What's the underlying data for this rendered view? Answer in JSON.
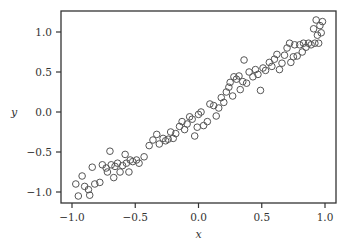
{
  "chart_data": {
    "type": "scatter",
    "title": "",
    "xlabel": "x",
    "ylabel": "y",
    "xlim": [
      -1.09,
      1.09
    ],
    "ylim": [
      -1.14,
      1.27
    ],
    "xticks": [
      -1.0,
      -0.5,
      0.0,
      0.5,
      1.0
    ],
    "xtick_labels": [
      "−1.0",
      "−0.5",
      "0.0",
      "0.5",
      "1.0"
    ],
    "yticks": [
      -1.0,
      -0.5,
      0.0,
      0.5,
      1.0
    ],
    "ytick_labels": [
      "−1.0",
      "−0.5",
      "0.0",
      "0.5",
      "1.0"
    ],
    "grid": false,
    "legend": null,
    "marker": "hollow-circle",
    "marker_color": "#555555",
    "points": [
      [
        -0.97,
        -0.9
      ],
      [
        -0.95,
        -1.05
      ],
      [
        -0.92,
        -0.8
      ],
      [
        -0.9,
        -0.93
      ],
      [
        -0.87,
        -0.97
      ],
      [
        -0.86,
        -1.04
      ],
      [
        -0.84,
        -0.69
      ],
      [
        -0.82,
        -0.9
      ],
      [
        -0.78,
        -0.88
      ],
      [
        -0.76,
        -0.66
      ],
      [
        -0.73,
        -0.7
      ],
      [
        -0.72,
        -0.75
      ],
      [
        -0.7,
        -0.49
      ],
      [
        -0.69,
        -0.66
      ],
      [
        -0.67,
        -0.82
      ],
      [
        -0.66,
        -0.68
      ],
      [
        -0.64,
        -0.64
      ],
      [
        -0.62,
        -0.75
      ],
      [
        -0.6,
        -0.67
      ],
      [
        -0.58,
        -0.53
      ],
      [
        -0.57,
        -0.64
      ],
      [
        -0.55,
        -0.75
      ],
      [
        -0.54,
        -0.6
      ],
      [
        -0.52,
        -0.62
      ],
      [
        -0.49,
        -0.6
      ],
      [
        -0.47,
        -0.64
      ],
      [
        -0.43,
        -0.56
      ],
      [
        -0.39,
        -0.42
      ],
      [
        -0.36,
        -0.35
      ],
      [
        -0.33,
        -0.28
      ],
      [
        -0.31,
        -0.4
      ],
      [
        -0.28,
        -0.33
      ],
      [
        -0.26,
        -0.36
      ],
      [
        -0.24,
        -0.34
      ],
      [
        -0.22,
        -0.25
      ],
      [
        -0.2,
        -0.33
      ],
      [
        -0.18,
        -0.27
      ],
      [
        -0.15,
        -0.18
      ],
      [
        -0.13,
        -0.12
      ],
      [
        -0.11,
        -0.22
      ],
      [
        -0.09,
        -0.15
      ],
      [
        -0.07,
        -0.06
      ],
      [
        -0.05,
        -0.09
      ],
      [
        -0.03,
        -0.3
      ],
      [
        -0.01,
        -0.19
      ],
      [
        0.0,
        -0.03
      ],
      [
        0.02,
        0.0
      ],
      [
        0.04,
        -0.17
      ],
      [
        0.07,
        -0.12
      ],
      [
        0.09,
        0.1
      ],
      [
        0.12,
        0.08
      ],
      [
        0.14,
        -0.05
      ],
      [
        0.16,
        0.05
      ],
      [
        0.18,
        0.18
      ],
      [
        0.2,
        0.12
      ],
      [
        0.22,
        0.25
      ],
      [
        0.24,
        0.31
      ],
      [
        0.25,
        0.37
      ],
      [
        0.27,
        0.2
      ],
      [
        0.28,
        0.44
      ],
      [
        0.3,
        0.41
      ],
      [
        0.32,
        0.45
      ],
      [
        0.33,
        0.28
      ],
      [
        0.35,
        0.38
      ],
      [
        0.36,
        0.65
      ],
      [
        0.38,
        0.36
      ],
      [
        0.4,
        0.5
      ],
      [
        0.43,
        0.44
      ],
      [
        0.45,
        0.53
      ],
      [
        0.47,
        0.47
      ],
      [
        0.49,
        0.27
      ],
      [
        0.51,
        0.55
      ],
      [
        0.53,
        0.52
      ],
      [
        0.56,
        0.62
      ],
      [
        0.58,
        0.57
      ],
      [
        0.6,
        0.66
      ],
      [
        0.62,
        0.72
      ],
      [
        0.64,
        0.53
      ],
      [
        0.66,
        0.61
      ],
      [
        0.68,
        0.71
      ],
      [
        0.7,
        0.8
      ],
      [
        0.72,
        0.86
      ],
      [
        0.73,
        0.62
      ],
      [
        0.75,
        0.69
      ],
      [
        0.76,
        0.84
      ],
      [
        0.78,
        0.7
      ],
      [
        0.8,
        0.84
      ],
      [
        0.82,
        0.75
      ],
      [
        0.83,
        0.86
      ],
      [
        0.85,
        0.81
      ],
      [
        0.87,
        0.86
      ],
      [
        0.89,
        0.84
      ],
      [
        0.91,
        1.04
      ],
      [
        0.92,
        0.86
      ],
      [
        0.93,
        1.15
      ],
      [
        0.94,
        0.96
      ],
      [
        0.95,
        0.86
      ],
      [
        0.96,
        1.08
      ],
      [
        0.97,
        0.99
      ],
      [
        0.98,
        1.13
      ]
    ]
  }
}
